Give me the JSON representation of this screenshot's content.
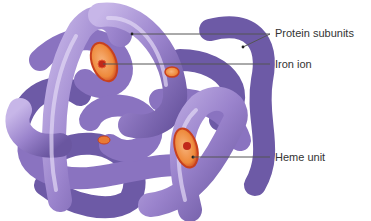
{
  "figure": {
    "labels": [
      {
        "id": "protein-subunits",
        "text": "Protein subunits",
        "x": 276,
        "y": 28
      },
      {
        "id": "iron-ion",
        "text": "Iron ion",
        "x": 276,
        "y": 60
      },
      {
        "id": "heme-unit",
        "text": "Heme unit",
        "x": 276,
        "y": 152
      }
    ]
  },
  "colors": {
    "protein_light": "#b9a6de",
    "protein_mid": "#8f78c4",
    "protein_dark": "#5f4c94",
    "heme_disc": "#f0883a",
    "heme_rim": "#c8401e",
    "iron": "#c0281a",
    "leader_line": "#555555",
    "text": "#333333"
  }
}
